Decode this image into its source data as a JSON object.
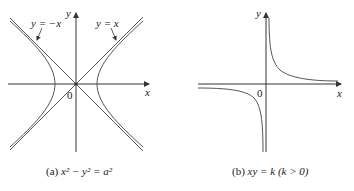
{
  "figures": [
    {
      "id": "a",
      "caption_prefix": "(a) ",
      "caption": "x² − y² = a²",
      "axis_x_label": "x",
      "axis_y_label": "y",
      "origin_label": "0",
      "asymptote_labels": [
        "y = −x",
        "y = x"
      ]
    },
    {
      "id": "b",
      "caption_prefix": "(b) ",
      "caption": "xy = k  (k > 0)",
      "axis_x_label": "x",
      "axis_y_label": "y",
      "origin_label": "0"
    }
  ],
  "colors": {
    "curve": "#555555",
    "axis": "#333333",
    "text": "#222222"
  }
}
